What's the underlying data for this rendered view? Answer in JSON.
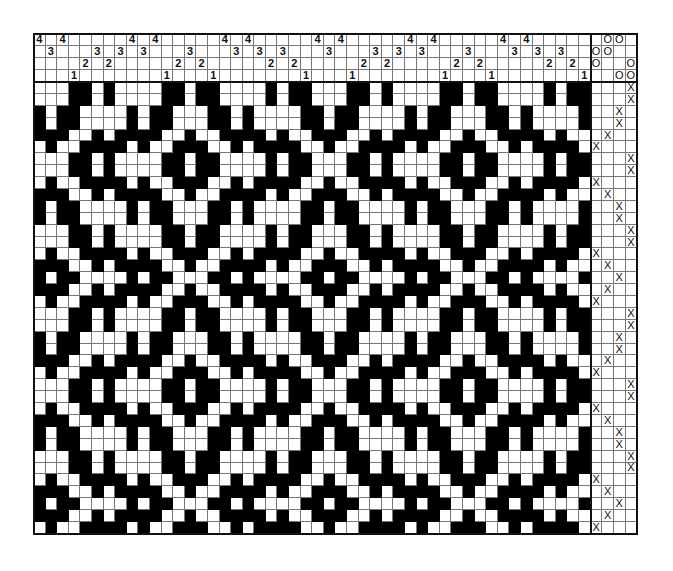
{
  "layout": {
    "columns": 48,
    "shafts": 4,
    "treadles": 4,
    "cell_w": 11.6,
    "cell_h": 11.9,
    "thread_row_h": 12
  },
  "threading": [
    4,
    3,
    4,
    1,
    2,
    3,
    2,
    3,
    4,
    3,
    4,
    1,
    2,
    3,
    2,
    1,
    4,
    3,
    4,
    3,
    2,
    3,
    2,
    1,
    4,
    3,
    4,
    1,
    2,
    3,
    2,
    3,
    4,
    3,
    4,
    1,
    2,
    3,
    2,
    1,
    4,
    3,
    4,
    3,
    2,
    3,
    2,
    1
  ],
  "tieup": {
    "symbol": "O",
    "rows_shaft_4_to_1": [
      [
        0,
        1,
        1,
        0
      ],
      [
        1,
        1,
        0,
        0
      ],
      [
        1,
        0,
        0,
        1
      ],
      [
        0,
        0,
        1,
        1
      ]
    ]
  },
  "treadling": {
    "symbol": "X",
    "sequence": [
      4,
      4,
      3,
      3,
      2,
      1,
      4,
      4,
      1,
      2,
      3,
      3,
      4,
      4,
      1,
      2,
      3,
      2,
      1,
      4,
      4,
      3,
      3,
      2,
      1,
      4,
      4,
      1,
      2,
      3,
      3,
      4,
      4,
      1,
      2,
      3,
      2,
      1
    ]
  },
  "colors": {
    "raised": "#000000",
    "lowered": "#ffffff",
    "grid": "#777777"
  }
}
